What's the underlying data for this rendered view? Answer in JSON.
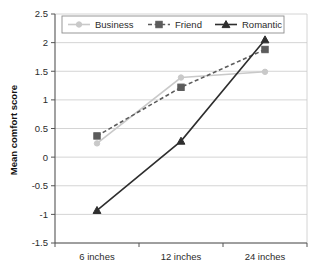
{
  "chart_data": {
    "type": "line",
    "title": "",
    "xlabel": "",
    "ylabel": "Mean comfort score",
    "categories": [
      "6 inches",
      "12 inches",
      "24 inches"
    ],
    "ylim": [
      -1.5,
      2.5
    ],
    "ytick_labels": [
      "2.5",
      "2",
      "1.5",
      "1",
      "0.5",
      "0",
      "-0.5",
      "-1",
      "-1.5"
    ],
    "ytick_values": [
      2.5,
      2,
      1.5,
      1,
      0.5,
      0,
      -0.5,
      -1,
      -1.5
    ],
    "grid": true,
    "legend_position": "top-center",
    "series": [
      {
        "name": "Business",
        "values": [
          0.24,
          1.39,
          1.49
        ],
        "color": "#c9c9c9",
        "line_style": "solid",
        "marker": "circle"
      },
      {
        "name": "Friend",
        "values": [
          0.37,
          1.22,
          1.88
        ],
        "color": "#5c5c5c",
        "line_style": "dashed",
        "marker": "square"
      },
      {
        "name": "Romantic",
        "values": [
          -0.93,
          0.28,
          2.05
        ],
        "color": "#2e2e2e",
        "line_style": "solid",
        "marker": "triangle"
      }
    ]
  },
  "legend": {
    "items": [
      {
        "label": "Business"
      },
      {
        "label": "Friend"
      },
      {
        "label": "Romantic"
      }
    ]
  },
  "axes": {
    "y_title": "Mean comfort score"
  }
}
